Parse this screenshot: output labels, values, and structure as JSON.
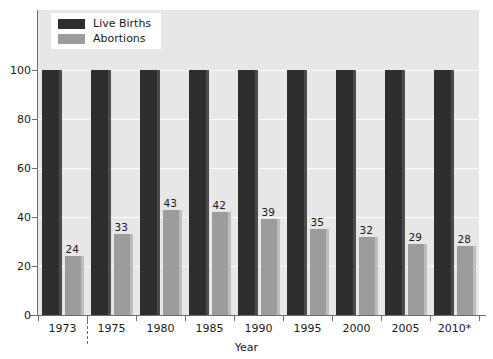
{
  "chart_data": {
    "type": "bar",
    "title": "",
    "xlabel": "Year",
    "ylabel": "",
    "ylim": [
      0,
      100
    ],
    "yticks": [
      0,
      20,
      40,
      60,
      80,
      100
    ],
    "grid": true,
    "legend_position": "top-left",
    "categories": [
      "1973",
      "1975",
      "1980",
      "1985",
      "1990",
      "1995",
      "2000",
      "2005",
      "2010*"
    ],
    "series": [
      {
        "name": "Live Births",
        "color": "#2e2e2e",
        "values": [
          100,
          100,
          100,
          100,
          100,
          100,
          100,
          100,
          100
        ],
        "labels_shown": false
      },
      {
        "name": "Abortions",
        "color": "#9c9c9c",
        "values": [
          24,
          33,
          43,
          42,
          39,
          35,
          32,
          29,
          28
        ],
        "labels_shown": true
      }
    ],
    "annotations": [
      {
        "name": "period-separator",
        "type": "dashed-vline",
        "after_category": "1973"
      }
    ]
  },
  "axis": {
    "x_title": "Year",
    "y_tick_labels": [
      "100",
      "80",
      "60",
      "40",
      "20",
      "0"
    ],
    "x_tick_labels": [
      "1973",
      "1975",
      "1980",
      "1985",
      "1990",
      "1995",
      "2000",
      "2005",
      "2010*"
    ]
  },
  "legend": {
    "items": [
      {
        "label": "Live Births",
        "swatch": "dark"
      },
      {
        "label": "Abortions",
        "swatch": "light"
      }
    ]
  },
  "bar_value_labels": [
    "24",
    "33",
    "43",
    "42",
    "39",
    "35",
    "32",
    "29",
    "28"
  ],
  "colors": {
    "plot_background": "#e7e7e7",
    "page_background": "#ffffff",
    "gridline": "#fbfbfb",
    "axis": "#6d6d6d",
    "live_births": "#2e2e2e",
    "abortions": "#9c9c9c",
    "text": "#1b1b1b"
  }
}
